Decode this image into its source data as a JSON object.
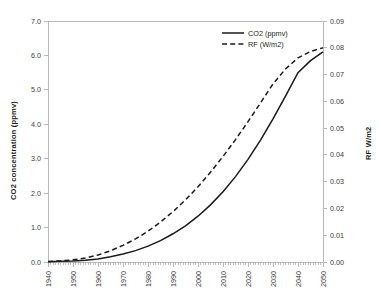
{
  "chart_data": {
    "type": "line",
    "title": "",
    "xlabel": "",
    "ylabel": "CO2 concentration (ppmv)",
    "y2label": "RF W/m2",
    "grid": false,
    "legend_position": "top-right",
    "xlim": [
      1940,
      2050
    ],
    "ylim": [
      0.0,
      7.0
    ],
    "y2lim": [
      0.0,
      0.09
    ],
    "x_ticks": [
      1940,
      1950,
      1960,
      1970,
      1980,
      1990,
      2000,
      2010,
      2020,
      2030,
      2040,
      2050
    ],
    "x_tick_labels": [
      "1940",
      "1950",
      "1960",
      "1970",
      "1980",
      "1990",
      "2000",
      "2010",
      "2020",
      "2030",
      "2040",
      "2050"
    ],
    "y_ticks": [
      0.0,
      1.0,
      2.0,
      3.0,
      4.0,
      5.0,
      6.0,
      7.0
    ],
    "y_tick_labels": [
      "0.0",
      "1.0",
      "2.0",
      "3.0",
      "4.0",
      "5.0",
      "6.0",
      "7.0"
    ],
    "y2_ticks": [
      0.0,
      0.01,
      0.02,
      0.03,
      0.04,
      0.05,
      0.06,
      0.07,
      0.08,
      0.09
    ],
    "y2_tick_labels": [
      "0.00",
      "0.01",
      "0.02",
      "0.03",
      "0.04",
      "0.05",
      "0.06",
      "0.07",
      "0.08",
      "0.09"
    ],
    "x": [
      1940,
      1945,
      1950,
      1955,
      1960,
      1965,
      1970,
      1975,
      1980,
      1985,
      1990,
      1995,
      2000,
      2005,
      2010,
      2015,
      2020,
      2025,
      2030,
      2035,
      2040,
      2045,
      2050
    ],
    "series": [
      {
        "name": "CO2 (ppmv)",
        "axis": "left",
        "style": "solid",
        "color": "#1a1a1a",
        "values": [
          0.01,
          0.02,
          0.03,
          0.05,
          0.09,
          0.15,
          0.23,
          0.33,
          0.46,
          0.62,
          0.82,
          1.05,
          1.33,
          1.66,
          2.04,
          2.48,
          2.98,
          3.54,
          4.16,
          4.82,
          5.5,
          5.85,
          6.1
        ]
      },
      {
        "name": "RF (W/m2)",
        "axis": "right",
        "style": "dashed",
        "color": "#1a1a1a",
        "values": [
          0.0002,
          0.0004,
          0.0008,
          0.0015,
          0.0026,
          0.0042,
          0.0062,
          0.0086,
          0.0115,
          0.0149,
          0.0188,
          0.0232,
          0.0281,
          0.0335,
          0.0394,
          0.0457,
          0.0524,
          0.0594,
          0.0665,
          0.0721,
          0.0762,
          0.0786,
          0.08
        ]
      }
    ],
    "legend": [
      {
        "label": "CO2 (ppmv)",
        "style": "solid"
      },
      {
        "label": "RF (W/m2)",
        "style": "dashed"
      }
    ]
  }
}
